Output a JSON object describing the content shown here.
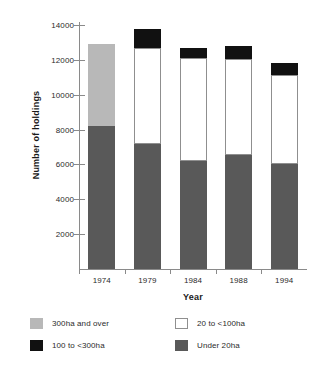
{
  "chart_data": {
    "type": "bar",
    "subtype": "stacked-vertical",
    "title": "",
    "xlabel": "Year",
    "ylabel": "Number of holdings",
    "categories": [
      "1974",
      "1979",
      "1984",
      "1988",
      "1994"
    ],
    "ylim": [
      0,
      14000
    ],
    "yticks": [
      2000,
      4000,
      6000,
      8000,
      10000,
      12000,
      14000
    ],
    "ytick_labels": [
      "2000",
      "4000",
      "6000",
      "8000",
      "10000",
      "12000",
      "14000"
    ],
    "grid": false,
    "legend_position": "below",
    "series": [
      {
        "name": "Under 20ha",
        "color": "#595959",
        "values": [
          8200,
          7150,
          6200,
          6550,
          6050
        ]
      },
      {
        "name": "20 to <100ha",
        "color": "#ffffff",
        "values": [
          0,
          5550,
          5900,
          5500,
          5100
        ]
      },
      {
        "name": "100 to <300ha",
        "color": "#111111",
        "values": [
          0,
          1050,
          600,
          750,
          650
        ]
      },
      {
        "name": "300ha and over",
        "color": "#b8b8b8",
        "values": [
          4700,
          0,
          0,
          0,
          0
        ]
      }
    ],
    "totals": [
      12900,
      13750,
      12700,
      12800,
      11800
    ],
    "legend": [
      {
        "label": "300ha and over",
        "key": "over300"
      },
      {
        "label": "20 to <100ha",
        "key": "t20to100"
      },
      {
        "label": "100 to <300ha",
        "key": "t100to300"
      },
      {
        "label": "Under 20ha",
        "key": "under20"
      }
    ]
  }
}
